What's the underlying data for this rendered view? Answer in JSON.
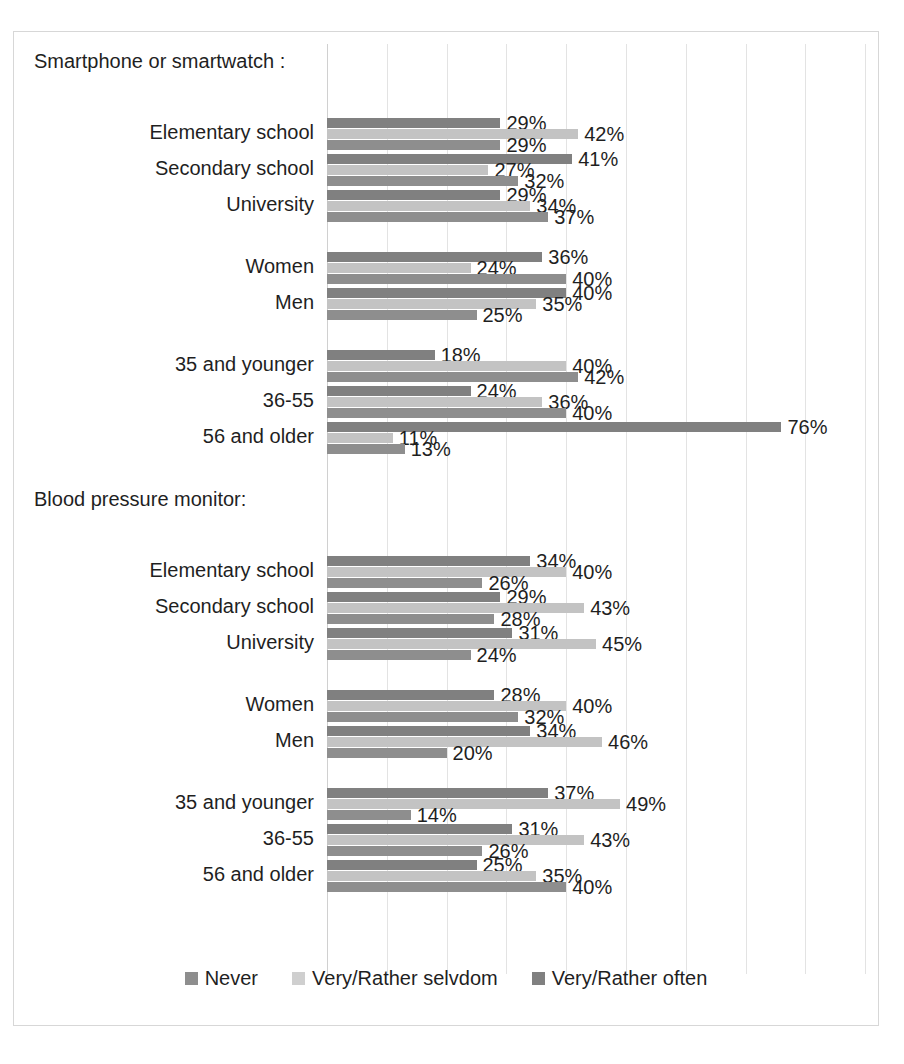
{
  "chart_data": {
    "type": "bar",
    "orientation": "horizontal",
    "title": "",
    "xlabel": "",
    "ylabel": "",
    "xlim": [
      0,
      90
    ],
    "grid": true,
    "legend_position": "bottom",
    "value_suffix": "%",
    "series_order_top_to_bottom": [
      "Very/Rather often",
      "Very/Rather selvdom",
      "Never"
    ],
    "legend": [
      {
        "name": "Never",
        "color": "#8e8e8e"
      },
      {
        "name": "Very/Rather selvdom",
        "color": "#cfcfcf"
      },
      {
        "name": "Very/Rather often",
        "color": "#808080"
      }
    ],
    "sections": [
      {
        "header": "Smartphone or smartwatch :",
        "groups": [
          {
            "categories": [
              {
                "label": "Elementary school",
                "often": 29,
                "seldom": 42,
                "never": 29
              },
              {
                "label": "Secondary school",
                "often": 41,
                "seldom": 27,
                "never": 32
              },
              {
                "label": "University",
                "often": 29,
                "seldom": 34,
                "never": 37
              }
            ]
          },
          {
            "categories": [
              {
                "label": "Women",
                "often": 36,
                "seldom": 24,
                "never": 40
              },
              {
                "label": "Men",
                "often": 40,
                "seldom": 35,
                "never": 25
              }
            ]
          },
          {
            "categories": [
              {
                "label": "35 and younger",
                "often": 18,
                "seldom": 40,
                "never": 42
              },
              {
                "label": "36-55",
                "often": 24,
                "seldom": 36,
                "never": 40
              },
              {
                "label": "56 and older",
                "often": 76,
                "seldom": 11,
                "never": 13
              }
            ]
          }
        ]
      },
      {
        "header": "Blood pressure monitor:",
        "groups": [
          {
            "categories": [
              {
                "label": "Elementary school",
                "often": 34,
                "seldom": 40,
                "never": 26
              },
              {
                "label": "Secondary school",
                "often": 29,
                "seldom": 43,
                "never": 28
              },
              {
                "label": "University",
                "often": 31,
                "seldom": 45,
                "never": 24
              }
            ]
          },
          {
            "categories": [
              {
                "label": "Women",
                "often": 28,
                "seldom": 40,
                "never": 32
              },
              {
                "label": "Men",
                "often": 34,
                "seldom": 46,
                "never": 20
              }
            ]
          },
          {
            "categories": [
              {
                "label": "35 and younger",
                "often": 37,
                "seldom": 49,
                "never": 14
              },
              {
                "label": "36-55",
                "often": 31,
                "seldom": 43,
                "never": 26
              },
              {
                "label": "56 and older",
                "often": 25,
                "seldom": 35,
                "never": 40
              }
            ]
          }
        ]
      }
    ]
  }
}
